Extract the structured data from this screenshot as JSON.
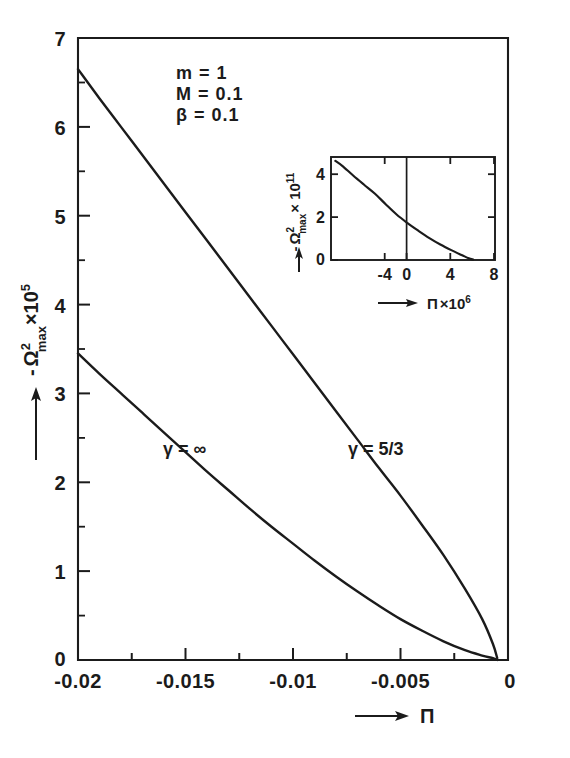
{
  "figure": {
    "background_color": "#ffffff",
    "ink_color": "#1b1b1b"
  },
  "chart_data": {
    "type": "line",
    "title": "",
    "xlabel": "—→ Π",
    "ylabel": "- Ω²max × 10⁵",
    "xlim": [
      -0.02,
      0
    ],
    "ylim": [
      0,
      7
    ],
    "grid": false,
    "legend": "inline curve labels",
    "x_ticks": [
      "-0.02",
      "-0.015",
      "-0.01",
      "-0.005",
      "0"
    ],
    "x_tick_values": [
      -0.02,
      -0.015,
      -0.01,
      -0.005,
      0
    ],
    "y_ticks": [
      "0",
      "1",
      "2",
      "3",
      "4",
      "5",
      "6",
      "7"
    ],
    "y_tick_values": [
      0,
      1,
      2,
      3,
      4,
      5,
      6,
      7
    ],
    "annotations": [
      {
        "text": "m  =   1"
      },
      {
        "text": "M  =   0.1"
      },
      {
        "text": "β  =   0.1"
      }
    ],
    "series": [
      {
        "name": "γ = 5/3",
        "label": "γ = 5/3",
        "x": [
          -0.02,
          -0.019,
          -0.018,
          -0.017,
          -0.016,
          -0.015,
          -0.014,
          -0.013,
          -0.012,
          -0.011,
          -0.01,
          -0.009,
          -0.008,
          -0.007,
          -0.006,
          -0.005,
          -0.004,
          -0.003,
          -0.002,
          -0.0012,
          -0.0007,
          -0.0005
        ],
        "y": [
          6.65,
          6.32,
          6.0,
          5.68,
          5.36,
          5.04,
          4.72,
          4.4,
          4.08,
          3.76,
          3.44,
          3.12,
          2.8,
          2.48,
          2.16,
          1.85,
          1.52,
          1.18,
          0.8,
          0.46,
          0.18,
          0.02
        ]
      },
      {
        "name": "γ = ∞",
        "label": "γ = ∞",
        "x": [
          -0.02,
          -0.019,
          -0.018,
          -0.017,
          -0.016,
          -0.015,
          -0.014,
          -0.013,
          -0.012,
          -0.011,
          -0.01,
          -0.009,
          -0.008,
          -0.007,
          -0.006,
          -0.005,
          -0.004,
          -0.003,
          -0.002,
          -0.0012,
          -0.0007,
          -0.0005
        ],
        "y": [
          3.45,
          3.22,
          3.0,
          2.78,
          2.56,
          2.34,
          2.12,
          1.91,
          1.7,
          1.5,
          1.31,
          1.12,
          0.94,
          0.77,
          0.61,
          0.46,
          0.33,
          0.21,
          0.11,
          0.05,
          0.02,
          0.0
        ]
      }
    ],
    "inset": {
      "type": "line",
      "xlabel": "—→ Π × 10⁶",
      "ylabel": "- Ω²max × 10¹¹",
      "xlim": [
        -6,
        9
      ],
      "ylim": [
        0,
        4.8
      ],
      "x_ticks": [
        "-4",
        "0",
        "4",
        "8"
      ],
      "x_tick_values": [
        -4,
        0,
        4,
        8
      ],
      "y_ticks": [
        "0",
        "2",
        "4"
      ],
      "y_tick_values": [
        0,
        2,
        4
      ],
      "zero_line": true,
      "series": [
        {
          "name": "inset-curve",
          "x": [
            -5.6,
            -5.0,
            -4.0,
            -3.0,
            -2.0,
            -1.0,
            0.0,
            1.0,
            2.0,
            3.0,
            4.0,
            5.0,
            6.0,
            6.6,
            7.0
          ],
          "y": [
            4.62,
            4.4,
            3.95,
            3.52,
            3.1,
            2.6,
            2.12,
            1.72,
            1.36,
            1.02,
            0.72,
            0.46,
            0.22,
            0.08,
            0.02
          ]
        }
      ]
    }
  },
  "axis_labels": {
    "y_main_prefix": "-",
    "y_main_symbol": "Ω",
    "y_main_sup": "2",
    "y_main_sub": "max",
    "y_main_times": "×10",
    "y_main_exp": "5",
    "x_main_symbol": "Π",
    "y_inset_prefix": "-",
    "y_inset_symbol": "Ω",
    "y_inset_sup": "2",
    "y_inset_sub": "max",
    "y_inset_times": "× 10",
    "y_inset_exp": "11",
    "x_inset_symbol": "Π",
    "x_inset_times": "×10",
    "x_inset_exp": "6"
  }
}
